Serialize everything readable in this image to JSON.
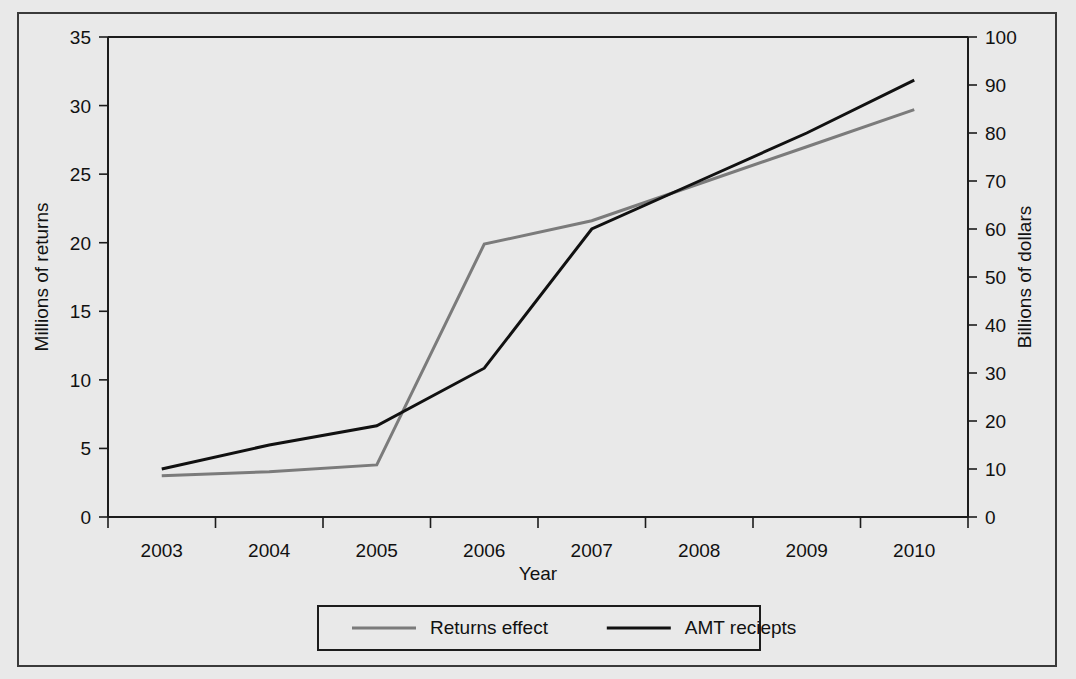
{
  "chart_data": {
    "type": "line",
    "title": "",
    "xlabel": "Year",
    "ylabel": "Millions of returns",
    "y2label": "Billions of dollars",
    "categories": [
      "2003",
      "2004",
      "2005",
      "2006",
      "2007",
      "2008",
      "2009",
      "2010"
    ],
    "x": [
      2003,
      2004,
      2005,
      2006,
      2007,
      2008,
      2009,
      2010
    ],
    "ylim": [
      0,
      35
    ],
    "y2lim": [
      0,
      100
    ],
    "yticks": [
      "0",
      "5",
      "10",
      "15",
      "20",
      "25",
      "30",
      "35"
    ],
    "ytick_values": [
      0,
      5,
      10,
      15,
      20,
      25,
      30,
      35
    ],
    "y2ticks": [
      "0",
      "10",
      "20",
      "30",
      "40",
      "50",
      "60",
      "70",
      "80",
      "90",
      "100"
    ],
    "y2tick_values": [
      0,
      10,
      20,
      30,
      40,
      50,
      60,
      70,
      80,
      90,
      100
    ],
    "grid": false,
    "legend_position": "bottom-center",
    "series": [
      {
        "name": "Returns effect",
        "axis": "left",
        "color": "#7b7b7b",
        "linewidth": 3,
        "values": [
          3.0,
          3.3,
          3.8,
          19.9,
          21.6,
          24.3,
          27.0,
          29.7
        ]
      },
      {
        "name": "AMT reciepts",
        "axis": "right",
        "color": "#111111",
        "linewidth": 3,
        "values": [
          10,
          15,
          19,
          31,
          60,
          70,
          80,
          91
        ]
      }
    ]
  },
  "axes": {
    "x_title": "Year",
    "y_left_title": "Millions of returns",
    "y_right_title": "Billions of dollars"
  },
  "legend": {
    "items": [
      {
        "label": "Returns effect",
        "color": "#7b7b7b"
      },
      {
        "label": "AMT reciepts",
        "color": "#111111"
      }
    ]
  }
}
